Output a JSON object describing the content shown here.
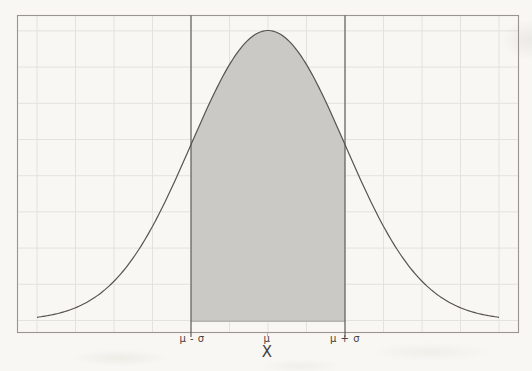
{
  "chart_data": {
    "type": "area",
    "subtype": "normal-distribution-density",
    "title": "",
    "xlabel": "X",
    "ylabel": "",
    "x_tick_labels": [
      "μ - σ",
      "μ",
      "μ + σ"
    ],
    "x_ticks_sigma": [
      -1,
      0,
      1
    ],
    "series": [
      {
        "name": "normal-density-curve",
        "distribution": "gaussian",
        "x_range_sigma": [
          -3,
          3
        ],
        "relative_height_at_mu": 1.0,
        "relative_height_at_sigma": 0.607
      }
    ],
    "shaded_region": {
      "from_sigma": -1,
      "to_sigma": 1
    },
    "reference_lines_sigma": [
      -1,
      1
    ],
    "grid": {
      "visible": true,
      "x_step_sigma": 0.5,
      "y_divisions": 8
    },
    "legend": null,
    "colors": {
      "background": "#f8f7f4",
      "fill": "#cac9c6",
      "curve": "#57544f",
      "frame": "#9a968f",
      "grid": "#e4e2dc",
      "sigma_lines": "#55524d",
      "baseline_edge": "#b7b5b0",
      "label": "#45423d"
    }
  }
}
